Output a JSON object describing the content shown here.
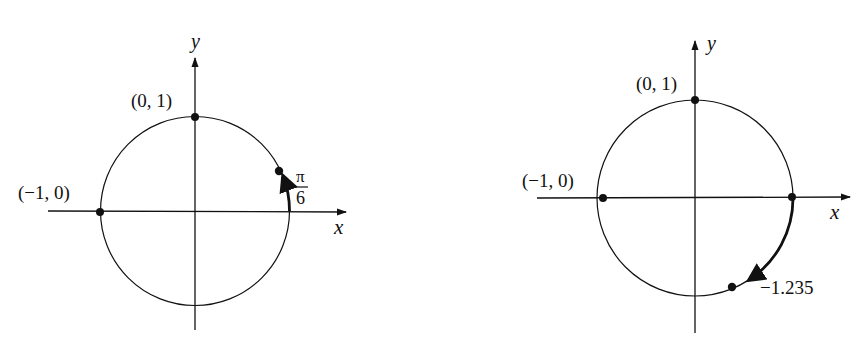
{
  "diagrams": [
    {
      "id": "left",
      "axis_x_label": "x",
      "axis_y_label": "y",
      "points": [
        {
          "label": "(0, 1)",
          "coords": [
            0,
            1
          ]
        },
        {
          "label": "(−1, 0)",
          "coords": [
            -1,
            0
          ]
        }
      ],
      "arc": {
        "start_angle": 0,
        "end_angle": 0.5236,
        "direction": "counterclockwise"
      },
      "arc_label": {
        "numerator": "π",
        "denominator": "6"
      }
    },
    {
      "id": "right",
      "axis_x_label": "x",
      "axis_y_label": "y",
      "points": [
        {
          "label": "(0, 1)",
          "coords": [
            0,
            1
          ]
        },
        {
          "label": "(−1, 0)",
          "coords": [
            -1,
            0
          ]
        },
        {
          "label": "",
          "coords": [
            1,
            0
          ]
        }
      ],
      "arc": {
        "start_angle": 0,
        "end_angle": -1.235,
        "direction": "clockwise"
      },
      "arc_label": "−1.235"
    }
  ],
  "colors": {
    "ink": "#111111",
    "background": "#ffffff"
  }
}
